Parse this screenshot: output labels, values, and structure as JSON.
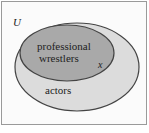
{
  "diagram": {
    "type": "venn",
    "universe_label": "U",
    "sets": [
      {
        "name": "actors",
        "label": "actors",
        "fill": "#dcdcdc"
      },
      {
        "name": "professional-wrestlers",
        "label_lines": [
          "professional",
          "wrestlers"
        ],
        "fill": "#a9a9a9",
        "subset_of": "actors"
      }
    ],
    "element_label": "x",
    "colors": {
      "outline": "#444444",
      "frame": "#9a9a9a",
      "background": "#fbfbfb"
    }
  }
}
